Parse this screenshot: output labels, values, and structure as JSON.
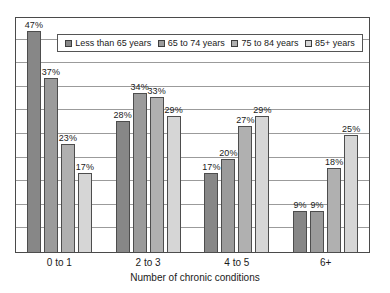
{
  "chart_data": {
    "type": "bar",
    "title": "",
    "subtitle": "",
    "xlabel": "Number of chronic conditions",
    "ylabel": "",
    "ylim": [
      0,
      50
    ],
    "ytick_step": 5,
    "grid": true,
    "yticks_visible": false,
    "legend_position": "top-inside",
    "value_suffix": "%",
    "categories": [
      "0 to 1",
      "2 to 3",
      "4 to 5",
      "6+"
    ],
    "series": [
      {
        "name": "Less than 65 years",
        "color": "#878787",
        "values": [
          47,
          28,
          17,
          9
        ],
        "labels": [
          "47%",
          "28%",
          "17%",
          "9%"
        ]
      },
      {
        "name": "65 to 74 years",
        "color": "#9b9b9b",
        "values": [
          37,
          34,
          20,
          9
        ],
        "labels": [
          "37%",
          "34%",
          "20%",
          "9%"
        ]
      },
      {
        "name": "75 to 84 years",
        "color": "#b0b0b0",
        "values": [
          23,
          33,
          27,
          18
        ],
        "labels": [
          "23%",
          "33%",
          "27%",
          "18%"
        ]
      },
      {
        "name": "85+ years",
        "color": "#d6d6d6",
        "values": [
          17,
          29,
          29,
          25
        ],
        "labels": [
          "17%",
          "29%",
          "29%",
          "25%"
        ]
      }
    ]
  },
  "legend": {
    "items": [
      {
        "label": "Less than 65 years",
        "color": "#878787"
      },
      {
        "label": "65 to 74 years",
        "color": "#9b9b9b"
      },
      {
        "label": "75 to 84 years",
        "color": "#b0b0b0"
      },
      {
        "label": "85+ years",
        "color": "#d6d6d6"
      }
    ]
  },
  "axis": {
    "x_title": "Number of chronic conditions",
    "x_tick_labels": [
      "0 to 1",
      "2 to 3",
      "4 to 5",
      "6+"
    ]
  },
  "style": {
    "frame_color": "#4a4a4a",
    "grid_color": "#9b9b9b",
    "bar_border_color": "#4d4d4d",
    "text_color": "#1a1a1a",
    "background": "#ffffff"
  }
}
